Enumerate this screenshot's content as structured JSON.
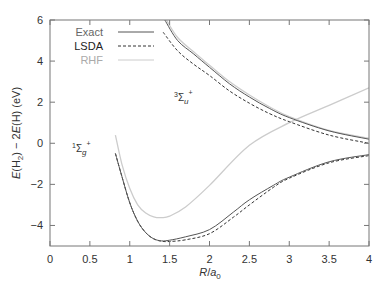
{
  "chart_data": {
    "type": "line",
    "title": "",
    "xlabel": "R/a0",
    "ylabel": "E(H2) - 2E(H) (eV)",
    "xlim": [
      0,
      4
    ],
    "ylim": [
      -5,
      6
    ],
    "xticks": [
      0,
      0.5,
      1,
      1.5,
      2,
      2.5,
      3,
      3.5,
      4
    ],
    "xtick_labels": [
      "0",
      "0.5",
      "1",
      "1.5",
      "2",
      "2.5",
      "3",
      "3.5",
      "4"
    ],
    "yticks": [
      -4,
      -2,
      0,
      2,
      4,
      6
    ],
    "ytick_labels": [
      "-4",
      "-2",
      "0",
      "2",
      "4",
      "6"
    ],
    "grid": false,
    "legend": {
      "position": "upper left",
      "entries": [
        {
          "label": "Exact",
          "style": "solid",
          "color": "#555555"
        },
        {
          "label": "LSDA",
          "style": "dashed",
          "color": "#333333"
        },
        {
          "label": "RHF",
          "style": "solid",
          "color": "#cccccc"
        }
      ]
    },
    "annotations": [
      {
        "text": "1Σg+",
        "state": "singlet",
        "x": 0.35,
        "y": 0.5
      },
      {
        "text": "3Σu+",
        "state": "triplet",
        "x": 1.55,
        "y": 2.4
      }
    ],
    "series": [
      {
        "name": "Exact",
        "state": "1Σg+",
        "style": "solid",
        "color": "#555555",
        "x": [
          0.82,
          0.9,
          1.0,
          1.1,
          1.2,
          1.3,
          1.4,
          1.5,
          1.7,
          2.0,
          2.3,
          2.5,
          2.8,
          3.0,
          3.5,
          4.0
        ],
        "y": [
          -0.5,
          -1.6,
          -2.9,
          -3.8,
          -4.35,
          -4.65,
          -4.75,
          -4.72,
          -4.55,
          -4.2,
          -3.35,
          -2.75,
          -2.05,
          -1.65,
          -0.9,
          -0.55
        ]
      },
      {
        "name": "LSDA",
        "state": "1Σg+",
        "style": "dashed",
        "color": "#333333",
        "x": [
          0.82,
          0.9,
          1.0,
          1.1,
          1.2,
          1.3,
          1.4,
          1.5,
          1.7,
          2.0,
          2.3,
          2.5,
          2.8,
          3.0,
          3.5,
          4.0
        ],
        "y": [
          -0.5,
          -1.6,
          -2.9,
          -3.8,
          -4.35,
          -4.65,
          -4.77,
          -4.78,
          -4.7,
          -4.4,
          -3.6,
          -3.0,
          -2.15,
          -1.7,
          -0.95,
          -0.6
        ]
      },
      {
        "name": "RHF",
        "state": "1Σg+",
        "style": "solid",
        "color": "#cccccc",
        "x": [
          0.82,
          0.9,
          1.0,
          1.1,
          1.2,
          1.3,
          1.4,
          1.5,
          1.7,
          2.0,
          2.5,
          3.0,
          3.5,
          4.0
        ],
        "y": [
          0.4,
          -1.0,
          -2.2,
          -3.0,
          -3.4,
          -3.58,
          -3.62,
          -3.55,
          -3.1,
          -2.05,
          -0.1,
          1.0,
          1.85,
          2.7
        ]
      },
      {
        "name": "Exact",
        "state": "3Σu+",
        "style": "solid",
        "color": "#555555",
        "x": [
          1.44,
          1.6,
          1.8,
          2.0,
          2.25,
          2.5,
          2.75,
          3.0,
          3.5,
          4.0
        ],
        "y": [
          6.0,
          5.0,
          4.35,
          3.7,
          2.9,
          2.25,
          1.7,
          1.25,
          0.6,
          0.2
        ]
      },
      {
        "name": "LSDA",
        "state": "3Σu+",
        "style": "dashed",
        "color": "#333333",
        "x": [
          1.42,
          1.6,
          1.8,
          2.0,
          2.25,
          2.5,
          2.75,
          3.0,
          3.5,
          4.0
        ],
        "y": [
          5.4,
          4.5,
          3.85,
          3.3,
          2.55,
          1.95,
          1.45,
          1.05,
          0.4,
          0.0
        ]
      },
      {
        "name": "RHF",
        "state": "3Σu+",
        "style": "solid",
        "color": "#cccccc",
        "x": [
          1.46,
          1.6,
          1.8,
          2.0,
          2.25,
          2.5,
          2.75,
          3.0,
          3.5,
          4.0
        ],
        "y": [
          6.0,
          5.15,
          4.45,
          3.8,
          3.0,
          2.35,
          1.78,
          1.3,
          0.62,
          0.25
        ]
      }
    ]
  },
  "labels": {
    "ylabel_prefix": "E",
    "ylabel_mid1": "(H",
    "ylabel_sub": "2",
    "ylabel_mid2": ") − 2",
    "ylabel_e2": "E",
    "ylabel_end": "(H) (eV)",
    "xlabel_r": "R",
    "xlabel_slash": "/",
    "xlabel_a": "a",
    "xlabel_sub": "0",
    "singlet_sup": "1",
    "singlet_sigma": "Σ",
    "singlet_sub": "g",
    "singlet_plus": "+",
    "triplet_sup": "3",
    "triplet_sigma": "Σ",
    "triplet_sub": "u",
    "triplet_plus": "+"
  }
}
